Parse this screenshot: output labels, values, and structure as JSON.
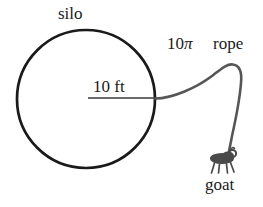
{
  "figure": {
    "labels": {
      "silo": "silo",
      "rope_length": "10",
      "rope_length_symbol": "π",
      "rope": "rope",
      "radius": "10 ft",
      "goat": "goat"
    },
    "colors": {
      "silo_stroke": "#1a1a1a",
      "rope_stroke": "#565656",
      "radius_stroke": "#3a3a3a",
      "goat_body": "#4a4a4a",
      "text": "#1a1a1a",
      "background": "#ffffff"
    },
    "geometry": {
      "silo_center_x": 86,
      "silo_center_y": 99,
      "silo_radius": 69,
      "silo_stroke_width": 2.6,
      "radius_line_x1": 88,
      "radius_line_x2": 156,
      "radius_line_y": 98,
      "rope_stroke_width": 2.6,
      "rope_tangent_x": 155,
      "rope_tangent_y": 98,
      "rope_peak_x": 229,
      "rope_peak_y": 64,
      "rope_end_x": 229,
      "rope_end_y": 152,
      "goat_x": 225,
      "goat_y": 160
    },
    "parts": [
      {
        "name": "silo-circle",
        "kind": "circle"
      },
      {
        "name": "radius-line",
        "kind": "line"
      },
      {
        "name": "rope-curve",
        "kind": "path"
      },
      {
        "name": "goat-figure",
        "kind": "glyph"
      }
    ]
  }
}
